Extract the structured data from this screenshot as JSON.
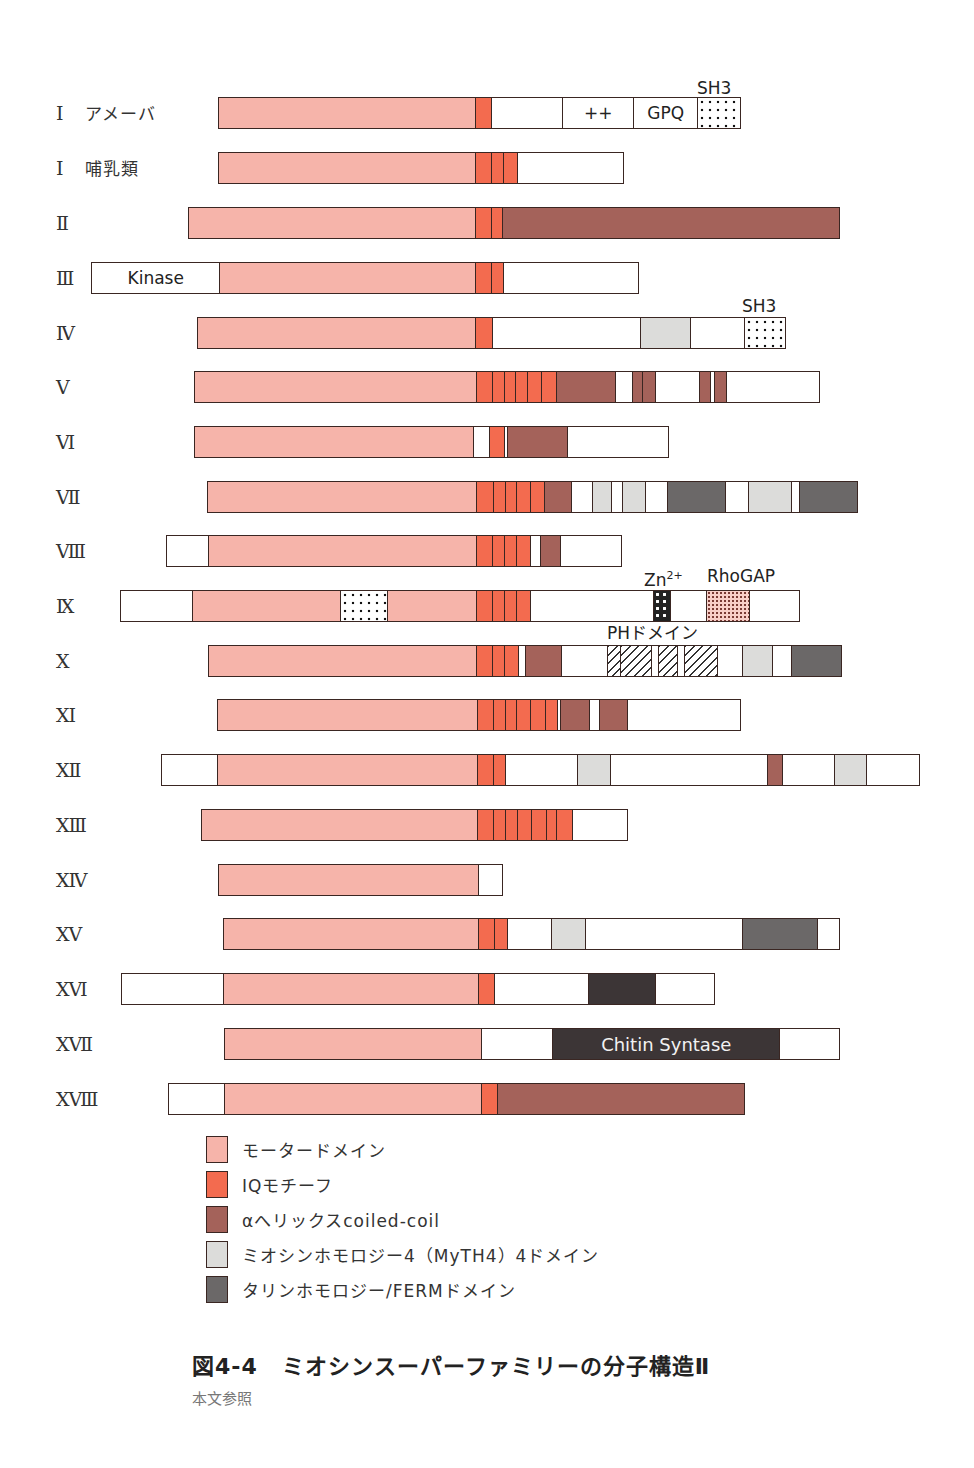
{
  "figure": {
    "number": "図4-4",
    "title": "ミオシンスーパーファミリーの分子構造Ⅱ",
    "subtitle": "本文参照"
  },
  "colors": {
    "motor": "#f6b4aa",
    "iq": "#f36b4f",
    "coil": "#a4625a",
    "myth4": "#dcdcda",
    "ferm": "#6b6868",
    "dark": "#3c3536",
    "outline": "#3a2622"
  },
  "legend": [
    {
      "type": "motor",
      "label": "モータードメイン"
    },
    {
      "type": "iq",
      "label": "IQモチーフ"
    },
    {
      "type": "coil",
      "label": "αへリックスcoiled-coil"
    },
    {
      "type": "myth4",
      "label": "ミオシンホモロジー4（MyTH4）4ドメイン"
    },
    {
      "type": "ferm",
      "label": "タリンホモロジー/FERMドメイン"
    }
  ],
  "annotations": [
    {
      "text": "SH3",
      "x": 697,
      "y": 79
    },
    {
      "text": "SH3",
      "x": 742,
      "y": 297
    },
    {
      "text": "Zn",
      "sup": "2+",
      "x": 644,
      "y": 567
    },
    {
      "text": "RhoGAP",
      "x": 707,
      "y": 567
    },
    {
      "text": "PHドメイン",
      "x": 607,
      "y": 624
    }
  ],
  "chart_data": {
    "type": "diagram",
    "title": "ミオシンスーパーファミリーの分子構造Ⅱ",
    "legend": [
      "モータードメイン",
      "IQモチーフ",
      "αへリックスcoiled-coil",
      "ミオシンホモロジー4（MyTH4）4ドメイン",
      "タリンホモロジー/FERMドメイン"
    ],
    "rows": [
      {
        "label": "Ⅰ",
        "sub": "アメーバ",
        "y": 97,
        "segments": [
          {
            "type": "motor",
            "x0": 218,
            "x1": 475
          },
          {
            "type": "iq",
            "x0": 475,
            "x1": 491
          },
          {
            "type": "empty",
            "x0": 491,
            "x1": 562
          },
          {
            "type": "empty",
            "x0": 562,
            "x1": 633,
            "text": "++"
          },
          {
            "type": "empty",
            "x0": 633,
            "x1": 697,
            "text": "GPQ"
          },
          {
            "type": "sh3",
            "x0": 697,
            "x1": 739
          }
        ]
      },
      {
        "label": "Ⅰ",
        "sub": "哺乳類",
        "y": 152,
        "segments": [
          {
            "type": "motor",
            "x0": 218,
            "x1": 475
          },
          {
            "type": "iq",
            "x0": 475,
            "x1": 491
          },
          {
            "type": "iq",
            "x0": 491,
            "x1": 503
          },
          {
            "type": "iq",
            "x0": 503,
            "x1": 517
          },
          {
            "type": "empty",
            "x0": 517,
            "x1": 622
          }
        ]
      },
      {
        "label": "Ⅱ",
        "sub": "",
        "y": 207,
        "segments": [
          {
            "type": "motor",
            "x0": 188,
            "x1": 475
          },
          {
            "type": "iq",
            "x0": 475,
            "x1": 491
          },
          {
            "type": "iq",
            "x0": 491,
            "x1": 502
          },
          {
            "type": "coil",
            "x0": 502,
            "x1": 838
          }
        ]
      },
      {
        "label": "Ⅲ",
        "sub": "",
        "y": 262,
        "segments": [
          {
            "type": "empty",
            "x0": 91,
            "x1": 219,
            "text": "Kinase"
          },
          {
            "type": "motor",
            "x0": 219,
            "x1": 475
          },
          {
            "type": "iq",
            "x0": 475,
            "x1": 491
          },
          {
            "type": "iq",
            "x0": 491,
            "x1": 503
          },
          {
            "type": "empty",
            "x0": 503,
            "x1": 637
          }
        ]
      },
      {
        "label": "Ⅳ",
        "sub": "",
        "y": 317,
        "segments": [
          {
            "type": "motor",
            "x0": 197,
            "x1": 475
          },
          {
            "type": "iq",
            "x0": 475,
            "x1": 492
          },
          {
            "type": "empty",
            "x0": 492,
            "x1": 640
          },
          {
            "type": "myth4",
            "x0": 640,
            "x1": 690
          },
          {
            "type": "empty",
            "x0": 690,
            "x1": 744
          },
          {
            "type": "sh3",
            "x0": 744,
            "x1": 784
          }
        ]
      },
      {
        "label": "Ⅴ",
        "sub": "",
        "y": 371,
        "segments": [
          {
            "type": "motor",
            "x0": 194,
            "x1": 476
          },
          {
            "type": "iq",
            "x0": 476,
            "x1": 492
          },
          {
            "type": "iq",
            "x0": 492,
            "x1": 504
          },
          {
            "type": "iq",
            "x0": 504,
            "x1": 515
          },
          {
            "type": "iq",
            "x0": 515,
            "x1": 527
          },
          {
            "type": "iq",
            "x0": 527,
            "x1": 541
          },
          {
            "type": "iq",
            "x0": 541,
            "x1": 556
          },
          {
            "type": "coil",
            "x0": 556,
            "x1": 615
          },
          {
            "type": "empty",
            "x0": 615,
            "x1": 632
          },
          {
            "type": "coil",
            "x0": 632,
            "x1": 642
          },
          {
            "type": "coil",
            "x0": 642,
            "x1": 655
          },
          {
            "type": "empty",
            "x0": 655,
            "x1": 699
          },
          {
            "type": "coil",
            "x0": 699,
            "x1": 710
          },
          {
            "type": "empty",
            "x0": 710,
            "x1": 714
          },
          {
            "type": "coil",
            "x0": 714,
            "x1": 726
          },
          {
            "type": "empty",
            "x0": 726,
            "x1": 818
          }
        ]
      },
      {
        "label": "Ⅵ",
        "sub": "",
        "y": 426,
        "segments": [
          {
            "type": "motor",
            "x0": 194,
            "x1": 473
          },
          {
            "type": "empty",
            "x0": 473,
            "x1": 489
          },
          {
            "type": "iq",
            "x0": 489,
            "x1": 504
          },
          {
            "type": "empty",
            "x0": 504,
            "x1": 507
          },
          {
            "type": "coil",
            "x0": 507,
            "x1": 567
          },
          {
            "type": "empty",
            "x0": 567,
            "x1": 667
          }
        ]
      },
      {
        "label": "Ⅶ",
        "sub": "",
        "y": 481,
        "segments": [
          {
            "type": "motor",
            "x0": 207,
            "x1": 476
          },
          {
            "type": "iq",
            "x0": 476,
            "x1": 493
          },
          {
            "type": "iq",
            "x0": 493,
            "x1": 505
          },
          {
            "type": "iq",
            "x0": 505,
            "x1": 516
          },
          {
            "type": "iq",
            "x0": 516,
            "x1": 530
          },
          {
            "type": "iq",
            "x0": 530,
            "x1": 544
          },
          {
            "type": "coil",
            "x0": 544,
            "x1": 571
          },
          {
            "type": "empty",
            "x0": 571,
            "x1": 592
          },
          {
            "type": "myth4",
            "x0": 592,
            "x1": 611
          },
          {
            "type": "empty",
            "x0": 611,
            "x1": 622
          },
          {
            "type": "myth4",
            "x0": 622,
            "x1": 645
          },
          {
            "type": "empty",
            "x0": 645,
            "x1": 667
          },
          {
            "type": "ferm",
            "x0": 667,
            "x1": 725
          },
          {
            "type": "empty",
            "x0": 725,
            "x1": 748
          },
          {
            "type": "myth4",
            "x0": 748,
            "x1": 791
          },
          {
            "type": "empty",
            "x0": 791,
            "x1": 799
          },
          {
            "type": "ferm",
            "x0": 799,
            "x1": 856
          }
        ]
      },
      {
        "label": "Ⅷ",
        "sub": "",
        "y": 535,
        "segments": [
          {
            "type": "empty",
            "x0": 166,
            "x1": 208
          },
          {
            "type": "motor",
            "x0": 208,
            "x1": 476
          },
          {
            "type": "iq",
            "x0": 476,
            "x1": 492
          },
          {
            "type": "iq",
            "x0": 492,
            "x1": 504
          },
          {
            "type": "iq",
            "x0": 504,
            "x1": 516
          },
          {
            "type": "iq",
            "x0": 516,
            "x1": 530
          },
          {
            "type": "empty",
            "x0": 530,
            "x1": 540
          },
          {
            "type": "coil",
            "x0": 540,
            "x1": 560
          },
          {
            "type": "empty",
            "x0": 560,
            "x1": 620
          }
        ]
      },
      {
        "label": "Ⅸ",
        "sub": "",
        "y": 590,
        "segments": [
          {
            "type": "empty",
            "x0": 120,
            "x1": 192
          },
          {
            "type": "motor",
            "x0": 192,
            "x1": 340
          },
          {
            "type": "sh3",
            "x0": 340,
            "x1": 387
          },
          {
            "type": "motor",
            "x0": 387,
            "x1": 476
          },
          {
            "type": "iq",
            "x0": 476,
            "x1": 492
          },
          {
            "type": "iq",
            "x0": 492,
            "x1": 504
          },
          {
            "type": "iq",
            "x0": 504,
            "x1": 516
          },
          {
            "type": "iq",
            "x0": 516,
            "x1": 530
          },
          {
            "type": "empty",
            "x0": 530,
            "x1": 653
          },
          {
            "type": "zn",
            "x0": 653,
            "x1": 670
          },
          {
            "type": "empty",
            "x0": 670,
            "x1": 706
          },
          {
            "type": "rhogap",
            "x0": 706,
            "x1": 749
          },
          {
            "type": "empty",
            "x0": 749,
            "x1": 798
          }
        ]
      },
      {
        "label": "Ⅹ",
        "sub": "",
        "y": 645,
        "segments": [
          {
            "type": "motor",
            "x0": 208,
            "x1": 476
          },
          {
            "type": "iq",
            "x0": 476,
            "x1": 492
          },
          {
            "type": "iq",
            "x0": 492,
            "x1": 504
          },
          {
            "type": "iq",
            "x0": 504,
            "x1": 518
          },
          {
            "type": "empty",
            "x0": 518,
            "x1": 525
          },
          {
            "type": "coil",
            "x0": 525,
            "x1": 561
          },
          {
            "type": "empty",
            "x0": 561,
            "x1": 607
          },
          {
            "type": "ph",
            "x0": 607,
            "x1": 620
          },
          {
            "type": "ph",
            "x0": 620,
            "x1": 651
          },
          {
            "type": "empty",
            "x0": 651,
            "x1": 658
          },
          {
            "type": "ph",
            "x0": 658,
            "x1": 677
          },
          {
            "type": "empty",
            "x0": 677,
            "x1": 684
          },
          {
            "type": "ph",
            "x0": 684,
            "x1": 717
          },
          {
            "type": "empty",
            "x0": 717,
            "x1": 742
          },
          {
            "type": "myth4",
            "x0": 742,
            "x1": 772
          },
          {
            "type": "empty",
            "x0": 772,
            "x1": 791
          },
          {
            "type": "ferm",
            "x0": 791,
            "x1": 840
          }
        ]
      },
      {
        "label": "ⅩⅠ",
        "sub": "",
        "y": 699,
        "segments": [
          {
            "type": "motor",
            "x0": 217,
            "x1": 477
          },
          {
            "type": "iq",
            "x0": 477,
            "x1": 493
          },
          {
            "type": "iq",
            "x0": 493,
            "x1": 505
          },
          {
            "type": "iq",
            "x0": 505,
            "x1": 516
          },
          {
            "type": "iq",
            "x0": 516,
            "x1": 530
          },
          {
            "type": "iq",
            "x0": 530,
            "x1": 545
          },
          {
            "type": "iq",
            "x0": 545,
            "x1": 557
          },
          {
            "type": "empty",
            "x0": 557,
            "x1": 560
          },
          {
            "type": "coil",
            "x0": 560,
            "x1": 589
          },
          {
            "type": "empty",
            "x0": 589,
            "x1": 599
          },
          {
            "type": "coil",
            "x0": 599,
            "x1": 627
          },
          {
            "type": "empty",
            "x0": 627,
            "x1": 739
          }
        ]
      },
      {
        "label": "ⅩⅡ",
        "sub": "",
        "y": 754,
        "segments": [
          {
            "type": "empty",
            "x0": 161,
            "x1": 217
          },
          {
            "type": "motor",
            "x0": 217,
            "x1": 477
          },
          {
            "type": "iq",
            "x0": 477,
            "x1": 493
          },
          {
            "type": "iq",
            "x0": 493,
            "x1": 505
          },
          {
            "type": "empty",
            "x0": 505,
            "x1": 577
          },
          {
            "type": "myth4",
            "x0": 577,
            "x1": 610
          },
          {
            "type": "empty",
            "x0": 610,
            "x1": 767
          },
          {
            "type": "coil",
            "x0": 767,
            "x1": 782
          },
          {
            "type": "empty",
            "x0": 782,
            "x1": 834
          },
          {
            "type": "myth4",
            "x0": 834,
            "x1": 866
          },
          {
            "type": "empty",
            "x0": 866,
            "x1": 918
          }
        ]
      },
      {
        "label": "ⅩⅢ",
        "sub": "",
        "y": 809,
        "segments": [
          {
            "type": "motor",
            "x0": 201,
            "x1": 477
          },
          {
            "type": "iq",
            "x0": 477,
            "x1": 493
          },
          {
            "type": "iq",
            "x0": 493,
            "x1": 505
          },
          {
            "type": "iq",
            "x0": 505,
            "x1": 517
          },
          {
            "type": "iq",
            "x0": 517,
            "x1": 531
          },
          {
            "type": "iq",
            "x0": 531,
            "x1": 546
          },
          {
            "type": "iq",
            "x0": 546,
            "x1": 556
          },
          {
            "type": "iq",
            "x0": 556,
            "x1": 572
          },
          {
            "type": "empty",
            "x0": 572,
            "x1": 626
          }
        ]
      },
      {
        "label": "ⅩⅣ",
        "sub": "",
        "y": 864,
        "segments": [
          {
            "type": "motor",
            "x0": 218,
            "x1": 478
          },
          {
            "type": "empty",
            "x0": 478,
            "x1": 501
          }
        ]
      },
      {
        "label": "ⅩⅤ",
        "sub": "",
        "y": 918,
        "segments": [
          {
            "type": "motor",
            "x0": 223,
            "x1": 478
          },
          {
            "type": "iq",
            "x0": 478,
            "x1": 494
          },
          {
            "type": "iq",
            "x0": 494,
            "x1": 507
          },
          {
            "type": "empty",
            "x0": 507,
            "x1": 551
          },
          {
            "type": "myth4",
            "x0": 551,
            "x1": 585
          },
          {
            "type": "empty",
            "x0": 585,
            "x1": 742
          },
          {
            "type": "ferm",
            "x0": 742,
            "x1": 817
          },
          {
            "type": "empty",
            "x0": 817,
            "x1": 838
          }
        ]
      },
      {
        "label": "ⅩⅥ",
        "sub": "",
        "y": 973,
        "segments": [
          {
            "type": "empty",
            "x0": 121,
            "x1": 223
          },
          {
            "type": "motor",
            "x0": 223,
            "x1": 478
          },
          {
            "type": "iq",
            "x0": 478,
            "x1": 494
          },
          {
            "type": "empty",
            "x0": 494,
            "x1": 588
          },
          {
            "type": "dark",
            "x0": 588,
            "x1": 655
          },
          {
            "type": "empty",
            "x0": 655,
            "x1": 713
          }
        ]
      },
      {
        "label": "ⅩⅦ",
        "sub": "",
        "y": 1028,
        "segments": [
          {
            "type": "motor",
            "x0": 224,
            "x1": 481
          },
          {
            "type": "empty",
            "x0": 481,
            "x1": 552
          },
          {
            "type": "dark",
            "x0": 552,
            "x1": 779,
            "text": "Chitin Syntase"
          },
          {
            "type": "empty",
            "x0": 779,
            "x1": 838
          }
        ]
      },
      {
        "label": "ⅩⅧ",
        "sub": "",
        "y": 1083,
        "segments": [
          {
            "type": "empty",
            "x0": 168,
            "x1": 224
          },
          {
            "type": "motor",
            "x0": 224,
            "x1": 481
          },
          {
            "type": "iq",
            "x0": 481,
            "x1": 497
          },
          {
            "type": "coil",
            "x0": 497,
            "x1": 743
          }
        ]
      }
    ]
  }
}
